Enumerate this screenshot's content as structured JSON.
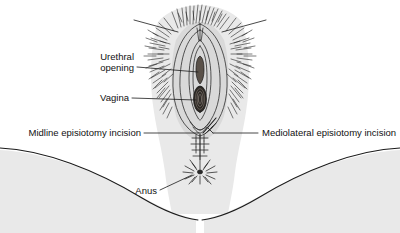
{
  "figure": {
    "title": "Episiotomy incision sites on the female perineum",
    "view": "lithotomy view of the vulva and perineum",
    "background_color": "#ffffff",
    "ink_color": "#1a1a1a",
    "shade_color": "#e9e9e9",
    "label_font_size_px": 9.5
  },
  "labels": {
    "urethral_opening": {
      "line1": "Urethral",
      "line2": "opening"
    },
    "vagina": {
      "text": "Vagina"
    },
    "midline": {
      "text": "Midline episiotomy incision"
    },
    "mediolateral": {
      "text": "Mediolateral episiotomy incision"
    },
    "anus": {
      "text": "Anus"
    }
  },
  "structures": [
    {
      "name": "mons-pubis-hair",
      "description": "pubic hair"
    },
    {
      "name": "labia-majora",
      "description": "outer labial folds"
    },
    {
      "name": "labia-minora",
      "description": "inner labial folds"
    },
    {
      "name": "urethral-opening",
      "description": "urethral meatus"
    },
    {
      "name": "vaginal-opening",
      "description": "vaginal introitus"
    },
    {
      "name": "perineum",
      "description": "perineal body"
    },
    {
      "name": "anus",
      "description": "anal opening"
    },
    {
      "name": "left-thigh",
      "description": "left inner thigh contour"
    },
    {
      "name": "right-thigh",
      "description": "right inner thigh contour"
    }
  ]
}
